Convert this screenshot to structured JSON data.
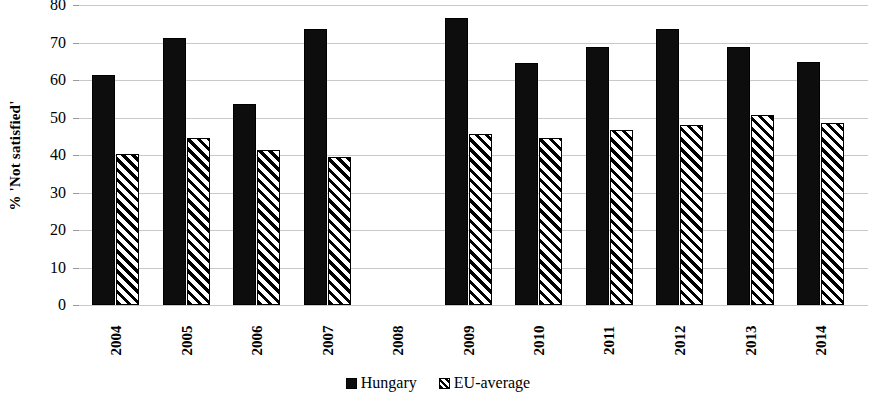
{
  "chart_data": {
    "type": "bar",
    "title": "",
    "subtitle": "",
    "xlabel": "",
    "ylabel": "% 'Not satisfied'",
    "categories": [
      "2004",
      "2005",
      "2006",
      "2007",
      "2008",
      "2009",
      "2010",
      "2011",
      "2012",
      "2013",
      "2014"
    ],
    "series": [
      {
        "name": "Hungary",
        "marker": "solid-black-square",
        "values": [
          61.3,
          71.3,
          53.5,
          73.5,
          null,
          76.6,
          64.6,
          68.7,
          73.6,
          68.7,
          64.7
        ]
      },
      {
        "name": "EU-average",
        "marker": "hatched-square",
        "values": [
          40.4,
          44.5,
          41.4,
          39.6,
          null,
          45.6,
          44.5,
          46.6,
          47.9,
          50.6,
          48.6
        ]
      }
    ],
    "ylim": [
      0,
      80
    ],
    "ytick_step": 10,
    "yticks": [
      "80",
      "70",
      "60",
      "50",
      "40",
      "30",
      "20",
      "10",
      "0"
    ],
    "grid": "horizontal",
    "grid_color": "#c9c9c9",
    "legend_position": "bottom-center",
    "missing_data_note": "2008 has no bars for either series",
    "colors": {
      "hungary": "#0d0d0d",
      "eu_average_fill": "#ffffff",
      "eu_average_hatch": "#000000",
      "background": "#ffffff"
    }
  },
  "legend": {
    "items": [
      {
        "label": "Hungary"
      },
      {
        "label": "EU-average"
      }
    ]
  }
}
